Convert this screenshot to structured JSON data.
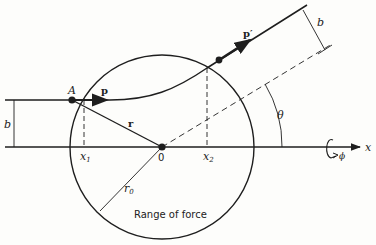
{
  "diagram": {
    "colors": {
      "stroke": "#1e1e1e",
      "background": "#fdfdfb"
    },
    "labels": {
      "point_A": "A",
      "momentum_in": "p",
      "momentum_out": "p′",
      "position_vector": "r",
      "impact_param_left": "b",
      "impact_param_right": "b",
      "angle": "θ",
      "x1": "x",
      "x1_sub": "1",
      "x2": "x",
      "x2_sub": "2",
      "origin": "0",
      "radius": "r",
      "radius_sub": "0",
      "axis": "x",
      "azimuth": "ϕ",
      "region": "Range of force"
    }
  }
}
